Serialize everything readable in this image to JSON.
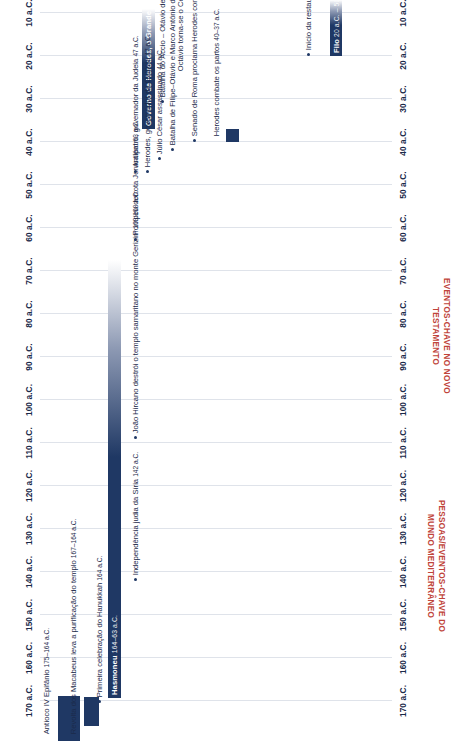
{
  "meta": {
    "orientation": "rotated-90",
    "accent_dark": "#1f3864",
    "accent_red": "#c0443a",
    "grid_color": "#dfe3ea"
  },
  "sections": {
    "new_testament_title": "EVENTOS-CHAVE NO NOVO TESTAMENTO",
    "mediterranean_title": "PESSOAS/EVENTOS-CHAVE DO MUNDO MEDITERRÂNEO"
  },
  "axis": {
    "ticks": [
      "170 a.C.",
      "160 a.C.",
      "150 a.C.",
      "140 a.C.",
      "130 a.C.",
      "120 a.C.",
      "110 a.C.",
      "100 a.C.",
      "90 a.C.",
      "80 a.C.",
      "70 a.C.",
      "60 a.C.",
      "50 a.C.",
      "40 a.C.",
      "30 a.C.",
      "20 a.C.",
      "10 a.C."
    ],
    "start_year": 170,
    "end_year": 10,
    "step": 10,
    "unit": "a.C."
  },
  "bars": [
    {
      "label": "Antíoco IV Epifânio",
      "years": "175–164 a.C.",
      "start": 175,
      "end": 164
    },
    {
      "label": "Revolta dos Macabeus leva a purificação do templo",
      "years": "167–164 a.C.",
      "start": 167,
      "end": 164
    },
    {
      "label": "Primeira celebração do Hanukkah",
      "years": "164 a.C.",
      "start": 164,
      "end": 164
    },
    {
      "label": "Hasmoneu",
      "years": "164–63 a.C.",
      "start": 164,
      "end": 63
    },
    {
      "label": "Governo de Herodes, o Grande",
      "years": "37–4 a.C.",
      "start": 37,
      "end": 4
    },
    {
      "label": "Filo",
      "years": "20 a.C. – 50 d.C.",
      "start": 20,
      "end": -50
    }
  ],
  "events": [
    {
      "label": "Independência judia da Síria",
      "years": "142 a.C.",
      "year": 142
    },
    {
      "label": "João Hircano destrói o templo samaritano no monte Gerizim",
      "years": "109/108 a.C.",
      "year": 109
    },
    {
      "label": "Pompeu derrota Jerusalém",
      "years": "63 a.C.",
      "year": 63
    },
    {
      "label": "Antípatro, governador da Judeia",
      "years": "47 a.C.",
      "year": 47
    },
    {
      "label": "Herodes, governador da Galileia",
      "years": "47 a.C.",
      "year": 47
    },
    {
      "label": "Júlio César assassinado",
      "years": "44 a.C.",
      "year": 44
    },
    {
      "label": "Batalha de Filipe–Otávio e Marco Antônio derrota Brutus e Cássio",
      "years": "42 a.C.",
      "year": 42
    },
    {
      "label": "Senado de Roma proclama Herodes como rei da Judeia",
      "years": "40 a.C.",
      "year": 40
    },
    {
      "label": "Herodes combate os partos",
      "years": "40–37 a.C.",
      "year": 40
    },
    {
      "label": "Batalha do Áccio – Otávio derrota Antônio e Cleópatra",
      "years": "31 a.C.",
      "year": 31
    },
    {
      "label": "Octávio torna-se o César Augusto e governa como o primeiro imperador romano",
      "years": "27 a.C. – 14 d.C.",
      "year": 27
    },
    {
      "label": "Início da restauração do templo",
      "years": "20 a.C.",
      "year": 20
    }
  ]
}
